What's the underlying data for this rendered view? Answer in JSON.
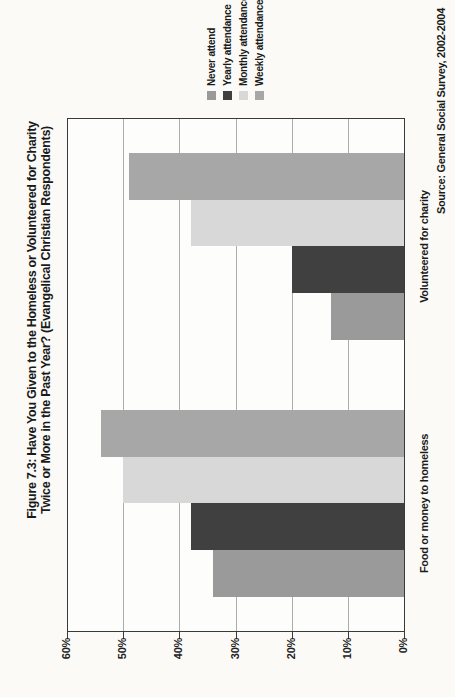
{
  "title": {
    "line1": "Figure 7.3: Have You Given to the Homeless or Volunteered for Charity",
    "line2": "Twice or More in the Past Year? (Evangelical Christian Respondents)"
  },
  "source": "Source: General Social Survey, 2002-2004",
  "colors": {
    "never": "#9a9a9a",
    "yearly": "#404040",
    "monthly": "#d8d8d8",
    "weekly": "#a7a7a7"
  },
  "chart_data": {
    "type": "bar",
    "note": "grouped column chart printed rotated 90deg CCW on portrait page",
    "categories": [
      "Food or money to homeless",
      "Volunteered for charity"
    ],
    "series": [
      {
        "name": "Never attend",
        "color": "#9a9a9a",
        "values": [
          34,
          13
        ]
      },
      {
        "name": "Yearly attendance",
        "color": "#404040",
        "values": [
          38,
          20
        ]
      },
      {
        "name": "Monthly attendance",
        "color": "#d8d8d8",
        "values": [
          50,
          38
        ]
      },
      {
        "name": "Weekly attendance",
        "color": "#a7a7a7",
        "values": [
          49,
          49
        ]
      }
    ],
    "title": "Figure 7.3: Have You Given to the Homeless or Volunteered for Charity Twice or More in the Past Year? (Evangelical Christian Respondents)",
    "xlabel": "",
    "ylabel": "",
    "ylim": [
      0,
      60
    ],
    "y_ticks": [
      "60%",
      "50%",
      "40%",
      "30%",
      "20%",
      "10%",
      "0%"
    ],
    "grid": true,
    "legend_position": "right",
    "values_correction": {
      "weekly_food": 54,
      "weekly_charity": 49
    }
  }
}
